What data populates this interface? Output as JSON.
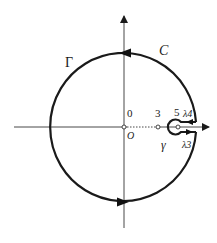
{
  "diagram": {
    "type": "contour-integral-keyhole",
    "colors": {
      "stroke": "#1a1a1a",
      "axis": "#333333",
      "background": "#ffffff"
    },
    "labels": {
      "outer_contour": "C",
      "big_circle": "Γ",
      "origin_value": "0",
      "origin_letter": "O",
      "point_three": "3",
      "point_five": "5",
      "small_circle": "γ",
      "upper_cut": "λ4",
      "lower_cut": "λ3"
    },
    "points": [
      {
        "name": "origin",
        "x": 0
      },
      {
        "name": "three",
        "x": 3
      },
      {
        "name": "five",
        "x": 5
      }
    ],
    "arrows": [
      {
        "location": "top",
        "direction": "left"
      },
      {
        "location": "bottom",
        "direction": "right"
      },
      {
        "location": "upper-cut",
        "direction": "left"
      },
      {
        "location": "lower-cut",
        "direction": "right"
      }
    ]
  }
}
